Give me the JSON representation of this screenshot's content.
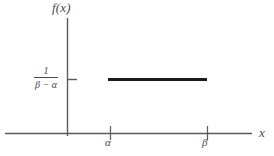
{
  "figure": {
    "background_color": "#ffffff",
    "ink_color": "#4a4a4a",
    "density_line_color": "#1c1c1c",
    "width": 274,
    "height": 156
  },
  "axes": {
    "y_axis_label": "f(x)",
    "x_axis_label": "x",
    "y_tick_label_numerator": "1",
    "y_tick_label_denominator": "β − α",
    "x_tick_labels": [
      "α",
      "β"
    ]
  },
  "chart_data": {
    "type": "line",
    "title": "",
    "subtitle": "",
    "xlabel": "x",
    "ylabel": "f(x)",
    "grid": false,
    "legend": "none",
    "annotations": [
      "Probability density function of the continuous uniform distribution on the interval [α, β]",
      "Constant density of height 1/(β − α) between x = α and x = β"
    ],
    "x_tick_labels": [
      "α",
      "β"
    ],
    "x_tick_values": [
      110,
      207
    ],
    "y_tick_labels": [
      "1/(β − α)"
    ],
    "y_tick_values": [
      79
    ],
    "xlim": [
      5,
      252
    ],
    "ylim": [
      133,
      18
    ],
    "series": [
      {
        "name": "uniform density",
        "type": "line",
        "linewidth": 3,
        "color": "#1c1c1c",
        "x": [
          108,
          207
        ],
        "y": [
          79,
          79
        ]
      }
    ]
  }
}
